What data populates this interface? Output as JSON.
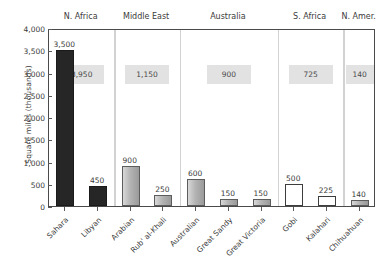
{
  "chart_data": {
    "type": "bar",
    "title": "",
    "xlabel": "",
    "ylabel": "Square miles (thousands)",
    "ylim": [
      0,
      4000
    ],
    "ytick_labels": [
      "4,000",
      "3,500",
      "3,000",
      "2,500",
      "2,000",
      "1,500",
      "1,000",
      "500",
      "0"
    ],
    "ytick_values": [
      4000,
      3500,
      3000,
      2500,
      2000,
      1500,
      1000,
      500,
      0
    ],
    "grid": false,
    "legend_position": "none",
    "categories": [
      "Sahara",
      "Libyan",
      "Arabian",
      "Rub' al-Khali",
      "Australian",
      "Great Sandy",
      "Great Victoria",
      "Gobi",
      "Kalahari",
      "Chihuahuan"
    ],
    "values": [
      3500,
      450,
      900,
      250,
      600,
      150,
      150,
      500,
      225,
      140
    ],
    "value_labels": [
      "3,500",
      "450",
      "900",
      "250",
      "600",
      "150",
      "150",
      "500",
      "225",
      "140"
    ],
    "bar_styles": [
      "black",
      "black",
      "gray",
      "gray",
      "gray",
      "gray",
      "gray",
      "white",
      "white",
      "gray"
    ],
    "groups": [
      {
        "label": "N. Africa",
        "total": 3950,
        "total_label": "3,950",
        "members": [
          "Sahara",
          "Libyan"
        ]
      },
      {
        "label": "Middle East",
        "total": 1150,
        "total_label": "1,150",
        "members": [
          "Arabian",
          "Rub' al-Khali"
        ]
      },
      {
        "label": "Australia",
        "total": 900,
        "total_label": "900",
        "members": [
          "Australian",
          "Great Sandy",
          "Great Victoria"
        ]
      },
      {
        "label": "S. Africa",
        "total": 725,
        "total_label": "725",
        "members": [
          "Gobi",
          "Kalahari"
        ]
      },
      {
        "label": "N. Amer.",
        "total": 140,
        "total_label": "140",
        "members": [
          "Chihuahuan"
        ]
      }
    ],
    "colors": {
      "bar_black": "#262626",
      "bar_gray": "#b4b4b4",
      "bar_white": "#ffffff",
      "badge_background": "#e2e2e2",
      "axis": "#4a4a4a",
      "text": "#3b3b3b",
      "divider": "#d2d2d2",
      "background": "#ffffff"
    }
  }
}
